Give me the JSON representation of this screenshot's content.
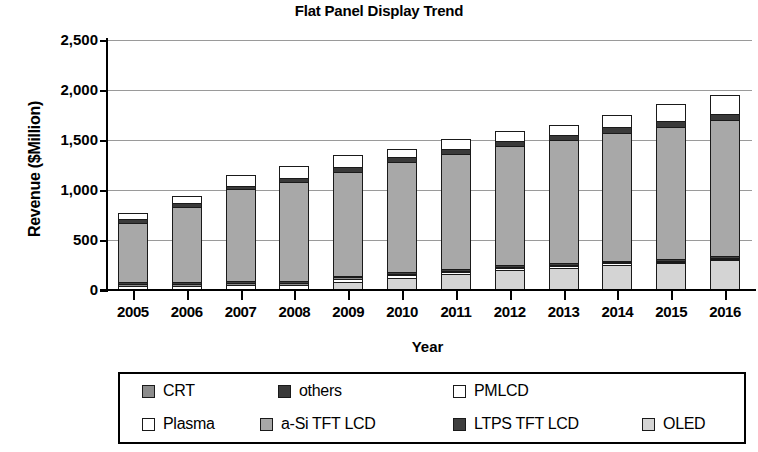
{
  "chart_data": {
    "type": "bar",
    "subtype": "stacked-column",
    "title": "Flat Panel Display Trend",
    "xlabel": "Year",
    "ylabel": "Revenue ($Million)",
    "categories": [
      "2005",
      "2006",
      "2007",
      "2008",
      "2009",
      "2010",
      "2011",
      "2012",
      "2013",
      "2014",
      "2015",
      "2016"
    ],
    "ylim": [
      0,
      2500
    ],
    "yticks": [
      0,
      500,
      1000,
      1500,
      2000,
      2500
    ],
    "ytick_labels": [
      "0",
      "500",
      "1,000",
      "1,500",
      "2,000",
      "2,500"
    ],
    "grid": true,
    "legend_position": "bottom",
    "series": [
      {
        "name": "OLED",
        "color": "#d4d4d4",
        "values": [
          10,
          12,
          15,
          20,
          90,
          130,
          170,
          210,
          235,
          265,
          285,
          310
        ]
      },
      {
        "name": "Plasma",
        "color": "#ffffff",
        "values": [
          40,
          45,
          50,
          55,
          45,
          40,
          35,
          30,
          25,
          22,
          20,
          18
        ]
      },
      {
        "name": "CRT",
        "color": "#8c8c8c",
        "values": [
          35,
          30,
          28,
          25,
          22,
          20,
          18,
          15,
          14,
          12,
          10,
          8
        ]
      },
      {
        "name": "LTPS TFT LCD",
        "color": "#3f3f3f",
        "values": [
          30,
          28,
          28,
          28,
          28,
          28,
          28,
          28,
          28,
          28,
          28,
          28
        ]
      },
      {
        "name": "a-Si TFT LCD",
        "color": "#a8a8a8",
        "values": [
          600,
          760,
          930,
          1000,
          1050,
          1110,
          1155,
          1200,
          1240,
          1290,
          1330,
          1370
        ]
      },
      {
        "name": "others",
        "color": "#3a3a3a",
        "values": [
          45,
          45,
          48,
          50,
          55,
          58,
          60,
          62,
          65,
          68,
          70,
          72
        ]
      },
      {
        "name": "PMLCD",
        "color": "#ffffff",
        "values": [
          70,
          80,
          120,
          135,
          130,
          90,
          115,
          110,
          110,
          130,
          175,
          205
        ]
      }
    ],
    "totals": [
      830,
      1000,
      1219,
      1313,
      1420,
      1476,
      1581,
      1655,
      1717,
      1815,
      1918,
      2011
    ]
  },
  "legend": {
    "rows": [
      [
        {
          "label": "CRT",
          "swatch": "#8c8c8c",
          "left": 22
        },
        {
          "label": "others",
          "swatch": "#3a3a3a",
          "left": 158
        },
        {
          "label": "PMLCD",
          "swatch": "#ffffff",
          "left": 333
        }
      ],
      [
        {
          "label": "Plasma",
          "swatch": "#ffffff",
          "left": 22
        },
        {
          "label": "a-Si TFT LCD",
          "swatch": "#a8a8a8",
          "left": 140
        },
        {
          "label": "LTPS TFT LCD",
          "swatch": "#3f3f3f",
          "left": 333
        },
        {
          "label": "OLED",
          "swatch": "#d4d4d4",
          "left": 522
        }
      ]
    ]
  }
}
